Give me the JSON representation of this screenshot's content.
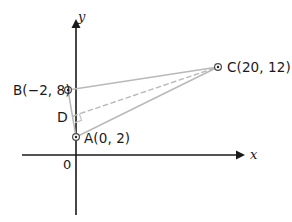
{
  "figure": {
    "canvas": {
      "width": 292,
      "height": 222,
      "background": "#ffffff"
    },
    "colors": {
      "axis": "#1a1a1a",
      "text": "#1a1a1a",
      "triangle_line": "#b9b9b9",
      "dashed_line": "#b9b9b9",
      "marker_outline": "#4a4a4a",
      "marker_fill": "#ffffff",
      "marker_dot": "#2b2b2b"
    },
    "axes": {
      "x_axis": {
        "label": "x",
        "y_px": 155,
        "x_start_px": 22,
        "x_end_px": 240,
        "arrow": "right"
      },
      "y_axis": {
        "label": "y",
        "x_px": 76,
        "y_start_px": 215,
        "y_end_px": 22,
        "arrow": "up"
      },
      "origin_label": "0"
    },
    "points": [
      {
        "id": "A",
        "label": "A(0, 2)",
        "coords": [
          0,
          2
        ],
        "px": [
          76,
          137
        ],
        "marker": "circle-dot",
        "label_px": [
          84,
          139
        ]
      },
      {
        "id": "B",
        "label": "B(−2, 8)",
        "coords": [
          -2,
          8
        ],
        "px": [
          68,
          90
        ],
        "marker": "circle-dot",
        "label_px": [
          13,
          91
        ]
      },
      {
        "id": "C",
        "label": "C(20, 12)",
        "coords": [
          20,
          12
        ],
        "px": [
          218,
          67
        ],
        "marker": "circle-dot",
        "label_px": [
          227,
          68
        ]
      },
      {
        "id": "D",
        "label": "D",
        "coords": null,
        "px": [
          73,
          116
        ],
        "marker": "none",
        "label_px": [
          58,
          117
        ]
      }
    ],
    "segments": [
      {
        "id": "BC",
        "from": "B",
        "to": "C",
        "style": "solid"
      },
      {
        "id": "BA",
        "from": "B",
        "to": "A",
        "style": "solid"
      },
      {
        "id": "AC",
        "from": "A",
        "to": "C",
        "style": "solid"
      },
      {
        "id": "DC",
        "from": "D",
        "to": "C",
        "style": "dashed"
      }
    ],
    "right_angle_marker": {
      "at": "D",
      "size_px": 7
    }
  }
}
